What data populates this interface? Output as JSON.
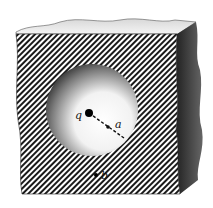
{
  "figure": {
    "labels": {
      "charge": "q",
      "radius": "a",
      "point": "b"
    },
    "colors": {
      "background": "#ffffff",
      "hatch": "#1a1a1a",
      "side_face": "#2a2a2a",
      "cavity_dark": "#3a3a3a",
      "cavity_light": "#ffffff"
    }
  }
}
